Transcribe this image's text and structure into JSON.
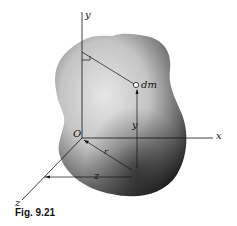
{
  "figure": {
    "caption": "Fig. 9.21",
    "labels": {
      "y_axis": "y",
      "x_axis": "x",
      "z_axis": "z",
      "origin": "O",
      "mass_element": "dm",
      "y_distance": "y",
      "r_distance": "r",
      "z_distance": "z"
    },
    "colors": {
      "body_light": "#d8d8d8",
      "body_dark": "#1c1c1c",
      "line": "#111111"
    }
  }
}
